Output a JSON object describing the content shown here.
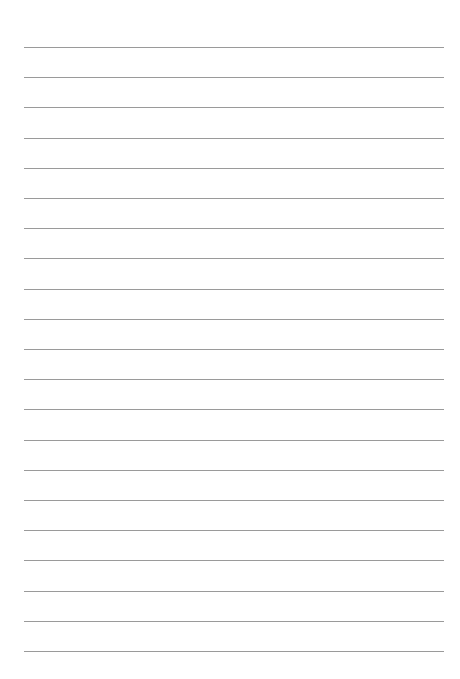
{
  "page": {
    "type": "lined-paper",
    "background": "#ffffff",
    "line_color": "#9a9a9a",
    "line_count": 21,
    "first_line_y": 47,
    "line_spacing": 30.2,
    "line_left": 24,
    "line_width": 420
  }
}
